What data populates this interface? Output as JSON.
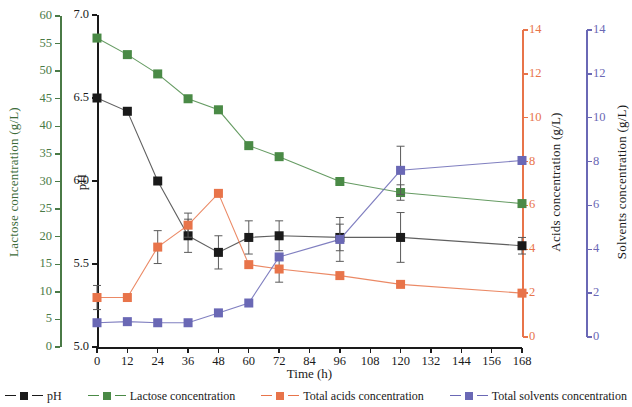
{
  "chart_data": {
    "type": "line",
    "title": "",
    "xlabel": "Time (h)",
    "x": [
      0,
      12,
      24,
      36,
      48,
      60,
      72,
      96,
      120,
      168
    ],
    "xticks": [
      0,
      12,
      24,
      36,
      48,
      60,
      72,
      84,
      96,
      108,
      120,
      132,
      144,
      156,
      168
    ],
    "xlim": [
      0,
      168
    ],
    "grid": false,
    "legend_position": "bottom",
    "axes": [
      {
        "id": "lactose",
        "label": "Lactose concentration (g/L)",
        "side": "left",
        "position": "outer",
        "lim": [
          0,
          60
        ],
        "ticks": [
          0,
          5,
          10,
          15,
          20,
          25,
          30,
          35,
          40,
          45,
          50,
          55,
          60
        ],
        "color": "#4a7a46"
      },
      {
        "id": "ph",
        "label": "pH",
        "side": "left",
        "position": "inner",
        "lim": [
          5.0,
          7.0
        ],
        "ticks": [
          "5.0",
          "5.5",
          "6.0",
          "6.5",
          "7.0"
        ],
        "color": "#1a1a1a"
      },
      {
        "id": "acids",
        "label": "Acids concentration (g/L)",
        "side": "right",
        "position": "inner",
        "lim": [
          0,
          14
        ],
        "ticks": [
          0,
          2,
          4,
          6,
          8,
          10,
          12,
          14
        ],
        "color": "#e8744a"
      },
      {
        "id": "solvents",
        "label": "Solvents concentration (g/L)",
        "side": "right",
        "position": "outer",
        "lim": [
          0,
          14
        ],
        "ticks": [
          0,
          2,
          4,
          6,
          8,
          10,
          12,
          14
        ],
        "color": "#6a68b5"
      }
    ],
    "series": [
      {
        "name": "pH",
        "axis": "ph",
        "color": "#1a1a1a",
        "marker": "square",
        "values": [
          6.5,
          6.42,
          6.0,
          5.67,
          5.57,
          5.66,
          5.67,
          5.66,
          5.66,
          5.61
        ],
        "errors": [
          0.0,
          0.0,
          0.0,
          0.1,
          0.1,
          0.1,
          0.09,
          0.08,
          0.15,
          0.05
        ]
      },
      {
        "name": "Lactose concentration",
        "axis": "lactose",
        "color": "#4a8a46",
        "marker": "square",
        "values": [
          56.0,
          53.0,
          49.5,
          45.0,
          43.0,
          36.5,
          34.5,
          30.0,
          28.0,
          26.0
        ],
        "errors": [
          0.6,
          0.5,
          0.4,
          0.4,
          0.4,
          0.4,
          0.4,
          0.4,
          1.4,
          0.4
        ]
      },
      {
        "name": "Total acids concentration",
        "axis": "acids",
        "color": "#e8744a",
        "marker": "square",
        "values": [
          1.8,
          1.8,
          4.1,
          5.1,
          6.55,
          3.3,
          3.1,
          2.8,
          2.4,
          2.0
        ],
        "errors": [
          0.55,
          0.0,
          0.75,
          0.55,
          0.0,
          0.0,
          0.6,
          0.0,
          0.0,
          0.0
        ]
      },
      {
        "name": "Total solvents concentration",
        "axis": "solvents",
        "color": "#6a68b5",
        "marker": "square",
        "values": [
          0.65,
          0.7,
          0.65,
          0.65,
          1.1,
          1.55,
          3.65,
          4.45,
          7.6,
          8.05
        ],
        "errors": [
          0.0,
          0.0,
          0.0,
          0.0,
          0.0,
          0.0,
          0.0,
          1.0,
          1.1,
          0.0
        ]
      }
    ],
    "legend": [
      {
        "label": "pH",
        "color": "#1a1a1a"
      },
      {
        "label": "Lactose concentration",
        "color": "#4a8a46"
      },
      {
        "label": "Total acids concentration",
        "color": "#e8744a"
      },
      {
        "label": "Total solvents concentration",
        "color": "#6a68b5"
      }
    ]
  }
}
